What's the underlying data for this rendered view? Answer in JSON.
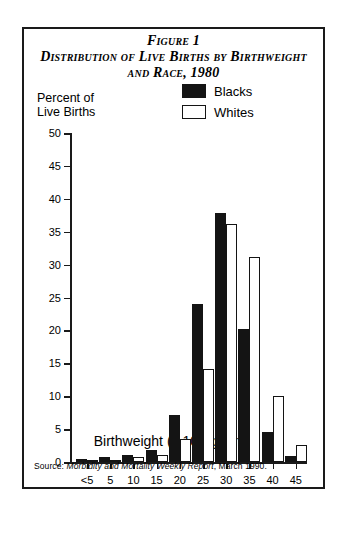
{
  "figure": {
    "title_figure": "Figure 1",
    "title_line1": "Distribution of Live Births by Birthweight",
    "title_line2": "and Race, 1980",
    "y_axis_caption": "Percent of\nLive Births",
    "x_axis_title": "Birthweight (x 100 grams)",
    "source_prefix": "Source: ",
    "source_italic": "Morbidity and Mortality Weekly Report",
    "source_suffix": ", March 1990."
  },
  "legend": {
    "position": "top-right-inside-plot",
    "items": [
      {
        "label": "Blacks",
        "swatch": "filled-black",
        "color": "#141414"
      },
      {
        "label": "Whites",
        "swatch": "outlined-white",
        "color": "#ffffff"
      }
    ]
  },
  "chart_data": {
    "type": "bar",
    "title": "Distribution of Live Births by Birthweight and Race, 1980",
    "subtitle": "Figure 1",
    "xlabel": "Birthweight (x 100 grams)",
    "ylabel": "Percent of Live Births",
    "categories": [
      "<5",
      "5",
      "10",
      "15",
      "20",
      "25",
      "30",
      "35",
      "40",
      "45"
    ],
    "series": [
      {
        "name": "Blacks",
        "color": "#141414",
        "values": [
          0.4,
          0.8,
          1.1,
          1.8,
          7.1,
          24.0,
          37.8,
          20.2,
          4.6,
          0.9
        ]
      },
      {
        "name": "Whites",
        "color": "#ffffff",
        "values": [
          0.1,
          0.3,
          0.8,
          1.0,
          3.5,
          14.2,
          36.2,
          31.2,
          10.0,
          2.6
        ]
      }
    ],
    "ylim": [
      0,
      50
    ],
    "yticks": [
      0,
      5,
      10,
      15,
      20,
      25,
      30,
      35,
      40,
      45,
      50
    ],
    "ytick_labels": [
      "0",
      "5",
      "10",
      "15",
      "20",
      "25",
      "30",
      "35",
      "40",
      "45",
      "50"
    ],
    "grid": false,
    "legend_position": "upper right"
  }
}
